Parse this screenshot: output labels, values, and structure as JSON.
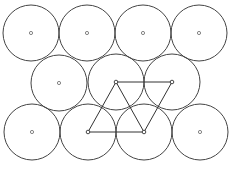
{
  "diagram": {
    "radius": 28,
    "colors": {
      "stroke": "#444444",
      "edge": "#333333",
      "background": "#ffffff"
    },
    "circles": [
      {
        "row": "top",
        "cx": 31,
        "cy": 33
      },
      {
        "row": "top",
        "cx": 87,
        "cy": 33
      },
      {
        "row": "top",
        "cx": 143,
        "cy": 33
      },
      {
        "row": "top",
        "cx": 199,
        "cy": 33
      },
      {
        "row": "middle",
        "cx": 59,
        "cy": 83
      },
      {
        "row": "middle",
        "cx": 116,
        "cy": 82
      },
      {
        "row": "middle",
        "cx": 172,
        "cy": 82
      },
      {
        "row": "bottom",
        "cx": 32,
        "cy": 132
      },
      {
        "row": "bottom",
        "cx": 88,
        "cy": 132
      },
      {
        "row": "bottom",
        "cx": 144,
        "cy": 132
      },
      {
        "row": "bottom",
        "cx": 200,
        "cy": 132
      }
    ],
    "triangle_vertices": [
      {
        "x": 116,
        "y": 82
      },
      {
        "x": 172,
        "y": 82
      },
      {
        "x": 88,
        "y": 132
      },
      {
        "x": 144,
        "y": 132
      }
    ],
    "edges": [
      [
        0,
        1
      ],
      [
        0,
        2
      ],
      [
        0,
        3
      ],
      [
        1,
        3
      ],
      [
        2,
        3
      ]
    ]
  }
}
